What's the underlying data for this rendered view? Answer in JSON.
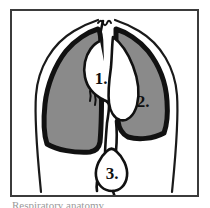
{
  "figure": {
    "caption_partial": "Respiratory anatomy",
    "frame_color": "#3b3b3b",
    "background_color": "#ffffff"
  },
  "colors": {
    "lung_fill": "#8a8a8a",
    "lung_outline": "#111111",
    "ribcage_outline": "#1a1a1a",
    "airway_fill": "#ffffff",
    "airway_outline": "#111111",
    "label_color": "#101010"
  },
  "parts": [
    {
      "id": "left-lung",
      "name": "left-lung",
      "fill": "#8a8a8a",
      "outline": "#111111"
    },
    {
      "id": "right-lung",
      "name": "right-lung",
      "fill": "#8a8a8a",
      "outline": "#111111"
    },
    {
      "id": "ribcage",
      "name": "ribcage-outline",
      "fill": "none",
      "outline": "#1a1a1a"
    },
    {
      "id": "airway",
      "name": "central-airway",
      "fill": "#ffffff",
      "outline": "#111111"
    }
  ],
  "callouts": [
    {
      "id": "callout-1",
      "label": "1.",
      "x": 99,
      "y": 77
    },
    {
      "id": "callout-2",
      "label": "2.",
      "x": 140,
      "y": 101
    },
    {
      "id": "callout-3",
      "label": "3.",
      "x": 128,
      "y": 172
    }
  ]
}
